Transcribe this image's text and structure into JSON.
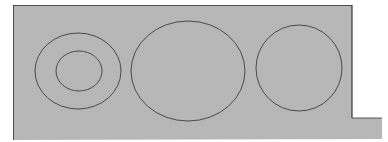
{
  "canvas": {
    "width": 388,
    "height": 142,
    "background": "#ffffff"
  },
  "colors": {
    "fill": "#b7b7b7",
    "stroke": "#4a4a4a",
    "edge": "#2a2a2a"
  },
  "plate": {
    "points": "13,5 352,5 352,118 382,118 382,139 13,140"
  },
  "shapes": [
    {
      "name": "left-outer-ellipse",
      "cx": 78,
      "cy": 71,
      "rx": 43,
      "ry": 38
    },
    {
      "name": "left-inner-ellipse",
      "cx": 79,
      "cy": 71,
      "rx": 23,
      "ry": 20
    },
    {
      "name": "middle-ellipse",
      "cx": 188,
      "cy": 71,
      "rx": 57,
      "ry": 50
    },
    {
      "name": "right-circle",
      "cx": 299,
      "cy": 68,
      "rx": 43,
      "ry": 43
    }
  ]
}
